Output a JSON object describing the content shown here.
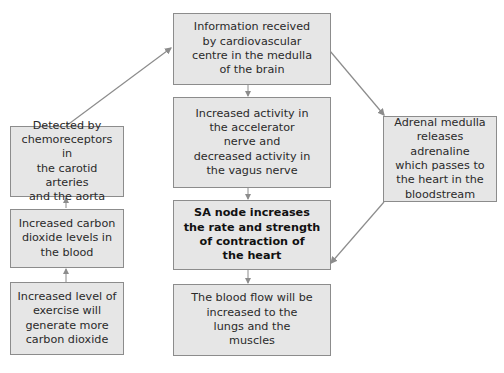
{
  "diagram": {
    "title": "",
    "colors": {
      "box_fill": "#e6e6e6",
      "box_border": "#8c8c8c",
      "arrow": "#8c8c8c",
      "text": "#2a2a2a"
    },
    "nodes": {
      "medulla": "Information received\nby cardiovascular\ncentre in the medulla\nof the brain",
      "nerves": "Increased activity in\nthe accelerator\nnerve and\ndecreased activity in\nthe vagus nerve",
      "sa_node": "SA node increases\nthe rate and strength\nof contraction of\nthe heart",
      "blood_flow": "The blood flow will be\nincreased to the\nlungs and the\nmuscles",
      "chemoreceptors": "Detected by\nchemoreceptors in\nthe carotid arteries\nand the aorta",
      "co2_levels": "Increased carbon\ndioxide levels in\nthe blood",
      "exercise": "Increased level of\nexercise will\ngenerate more\ncarbon dioxide",
      "adrenal": "Adrenal medulla\nreleases adrenaline\nwhich passes to\nthe heart in the\nbloodstream"
    },
    "edges": [
      {
        "from": "exercise",
        "to": "co2_levels"
      },
      {
        "from": "co2_levels",
        "to": "chemoreceptors"
      },
      {
        "from": "chemoreceptors",
        "to": "medulla"
      },
      {
        "from": "medulla",
        "to": "nerves"
      },
      {
        "from": "medulla",
        "to": "adrenal"
      },
      {
        "from": "nerves",
        "to": "sa_node"
      },
      {
        "from": "adrenal",
        "to": "sa_node"
      },
      {
        "from": "sa_node",
        "to": "blood_flow"
      }
    ]
  }
}
